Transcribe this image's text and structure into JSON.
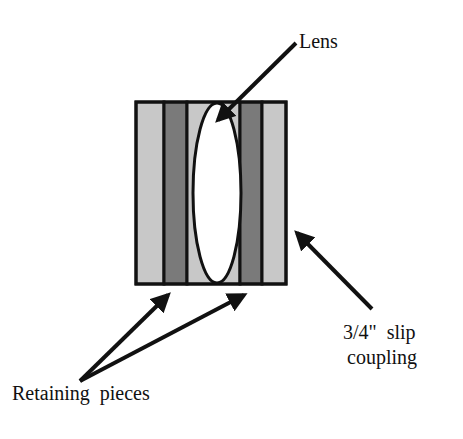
{
  "diagram": {
    "type": "lens-assembly-cross-section",
    "labels": {
      "lens": "Lens",
      "coupling_line1": "3/4\"  slip",
      "coupling_line2": "coupling",
      "retaining": "Retaining  pieces"
    },
    "colors": {
      "light_stripe": "#c8c8c8",
      "dark_stripe": "#7a7a7a",
      "outline": "#111111",
      "lens_fill": "#ffffff",
      "background": "#ffffff"
    },
    "components": [
      {
        "name": "outer-light-left",
        "shade": "light"
      },
      {
        "name": "retaining-piece-left",
        "shade": "dark"
      },
      {
        "name": "center-light",
        "shade": "light"
      },
      {
        "name": "retaining-piece-right",
        "shade": "dark"
      },
      {
        "name": "outer-light-right",
        "shade": "light"
      }
    ]
  }
}
